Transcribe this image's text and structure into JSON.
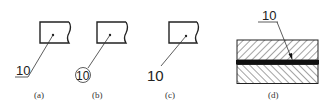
{
  "figure": {
    "panels": [
      {
        "id": "a",
        "caption": "(a)",
        "label": "10",
        "label_style": "underline"
      },
      {
        "id": "b",
        "caption": "(b)",
        "label": "10",
        "label_style": "circle"
      },
      {
        "id": "c",
        "caption": "(c)",
        "label": "10",
        "label_style": "plain"
      },
      {
        "id": "d",
        "caption": "(d)",
        "label": "10",
        "label_style": "underline-arrow"
      }
    ]
  },
  "colors": {
    "line": "#222222",
    "background": "#ffffff"
  }
}
